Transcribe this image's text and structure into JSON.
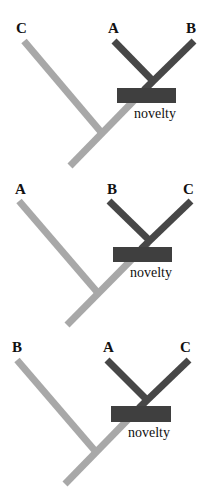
{
  "colors": {
    "background": "#ffffff",
    "outgroup_branch": "#a8a8a8",
    "ingroup_branch": "#474747",
    "novelty_box": "#3f3f3f",
    "text": "#111111"
  },
  "panels": [
    {
      "id": "panel-1",
      "taxa": {
        "left": "C",
        "middle": "A",
        "right": "B"
      },
      "novelty_label": "novelty"
    },
    {
      "id": "panel-2",
      "taxa": {
        "left": "A",
        "middle": "B",
        "right": "C"
      },
      "novelty_label": "novelty"
    },
    {
      "id": "panel-3",
      "taxa": {
        "left": "B",
        "middle": "A",
        "right": "C"
      },
      "novelty_label": "novelty"
    }
  ]
}
